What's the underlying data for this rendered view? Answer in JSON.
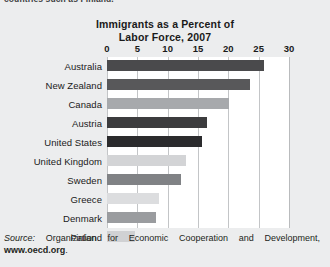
{
  "top_caption": "countries such as Finland.",
  "chart_data": {
    "type": "bar",
    "orientation": "horizontal",
    "title": "Immigrants as a Percent of Labor Force, 2007",
    "title_line1": "Immigrants as a Percent of",
    "title_line2": "Labor Force, 2007",
    "xlabel": "",
    "ylabel": "",
    "xlim": [
      0,
      30
    ],
    "xticks": [
      0,
      5,
      10,
      15,
      20,
      25,
      30
    ],
    "xtick_labels": [
      "0",
      "5",
      "10",
      "15",
      "20",
      "25",
      "30"
    ],
    "grid": "vertical",
    "legend": "none",
    "categories": [
      "Australia",
      "New Zealand",
      "Canada",
      "Austria",
      "United States",
      "United Kingdom",
      "Sweden",
      "Greece",
      "Denmark",
      "Finland"
    ],
    "values": [
      25.9,
      23.5,
      20.1,
      16.5,
      15.7,
      13.1,
      12.2,
      8.6,
      8.0,
      4.6
    ],
    "bar_colors": [
      "#4a4a4c",
      "#58585a",
      "#a7a9ac",
      "#3c3c3e",
      "#2b2b2d",
      "#d3d4d6",
      "#808285",
      "#dcdddf",
      "#9a9c9f",
      "#d0d1d3"
    ],
    "bars": [
      {
        "label": "Australia",
        "value": 25.9,
        "color": "#4a4a4c"
      },
      {
        "label": "New Zealand",
        "value": 23.5,
        "color": "#58585a"
      },
      {
        "label": "Canada",
        "value": 20.1,
        "color": "#a7a9ac"
      },
      {
        "label": "Austria",
        "value": 16.5,
        "color": "#3c3c3e"
      },
      {
        "label": "United States",
        "value": 15.7,
        "color": "#2b2b2d"
      },
      {
        "label": "United Kingdom",
        "value": 13.1,
        "color": "#d3d4d6"
      },
      {
        "label": "Sweden",
        "value": 12.2,
        "color": "#808285"
      },
      {
        "label": "Greece",
        "value": 8.6,
        "color": "#dcdddf"
      },
      {
        "label": "Denmark",
        "value": 8.0,
        "color": "#9a9c9f"
      },
      {
        "label": "Finland",
        "value": 4.6,
        "color": "#d0d1d3"
      }
    ],
    "plot_background": "#ffffff",
    "gridline_color": "#c3c5c7"
  },
  "source": {
    "prefix": "Source:",
    "body": " Organization for Economic Cooperation and Development,",
    "url": "www.oecd.org",
    "suffix": "."
  }
}
